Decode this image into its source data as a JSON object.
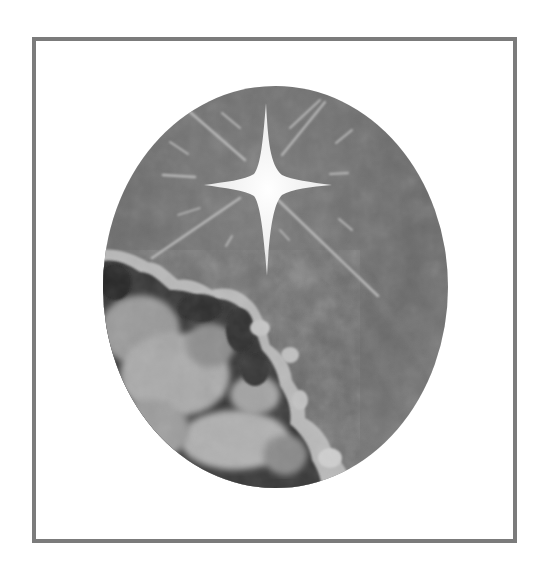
{
  "image": {
    "subject": "star-over-clouds-illustration",
    "description": "Grayscale painted oval vignette of a bright four-pointed star with radiating light rays over dark clouds in the lower left, inside a square gray frame",
    "colors": {
      "background": "#ffffff",
      "frame": "#7b7b7b",
      "sky": "#6e6e6e",
      "sky_light": "#858585",
      "star": "#f4f4f4",
      "rays": "#b4b4b4",
      "cloud_dark": "#2e2e2e",
      "cloud_mid": "#5a5a5a",
      "cloud_light": "#bdbdbd"
    },
    "frame": {
      "x": 32,
      "y": 37,
      "width": 485,
      "height": 506,
      "stroke": 4
    },
    "oval": {
      "cx": 275.5,
      "cy": 287,
      "rx": 172.5,
      "ry": 201
    },
    "star": {
      "cx": 266,
      "cy": 186,
      "points": 4
    }
  }
}
